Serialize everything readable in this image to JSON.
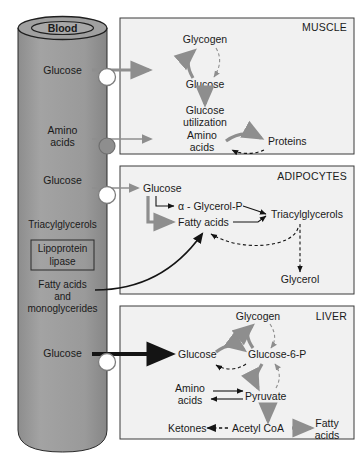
{
  "figure": {
    "type": "biochemical-pathway-diagram"
  },
  "colors": {
    "vessel_fill": "#9a9a9a",
    "tissue_box_fill": "#f1f1f1",
    "tissue_box_border": "#3a3a3a",
    "gray_arrow": "#8e8e8e",
    "black_arrow": "#141414",
    "text": "#1a1a1a",
    "open_transporter": "#ffffff",
    "filled_transporter": "#8e8e8e"
  },
  "blood_vessel": {
    "cap_label": "Blood",
    "substrates": [
      {
        "id": "vessel-glucose-muscle",
        "label": "Glucose"
      },
      {
        "id": "vessel-amino-acids",
        "label": "Amino\nacids",
        "line1": "Amino",
        "line2": "acids"
      },
      {
        "id": "vessel-glucose-adipocyte",
        "label": "Glucose"
      },
      {
        "id": "vessel-triacylglycerols",
        "label": "Triacylglycerols"
      },
      {
        "id": "vessel-fatty-acids-monoglycerides",
        "line1": "Fatty acids",
        "line2": "and",
        "line3": "monoglycerides"
      },
      {
        "id": "vessel-glucose-liver",
        "label": "Glucose"
      }
    ],
    "enzyme_box": {
      "line1": "Lipoprotein",
      "line2": "lipase"
    }
  },
  "tissues": [
    {
      "id": "muscle",
      "name": "MUSCLE",
      "nodes": [
        {
          "id": "muscle-glycogen",
          "label": "Glycogen"
        },
        {
          "id": "muscle-glucose",
          "label": "Glucose"
        },
        {
          "id": "muscle-glucose-utilization-1",
          "label": "Glucose"
        },
        {
          "id": "muscle-glucose-utilization-2",
          "label": "utilization"
        },
        {
          "id": "muscle-amino-acids-1",
          "label": "Amino"
        },
        {
          "id": "muscle-amino-acids-2",
          "label": "acids"
        },
        {
          "id": "muscle-proteins",
          "label": "Proteins"
        }
      ],
      "reactions": [
        {
          "from": "Glucose",
          "to": "Glycogen",
          "style": "solid-gray"
        },
        {
          "from": "Glycogen",
          "to": "Glucose",
          "style": "dashed-gray"
        },
        {
          "from": "Glucose",
          "to": "Glucose utilization",
          "style": "solid-gray"
        },
        {
          "from": "Amino acids",
          "to": "Proteins",
          "style": "solid-gray"
        },
        {
          "from": "Proteins",
          "to": "Amino acids",
          "style": "dashed-black"
        }
      ]
    },
    {
      "id": "adipocytes",
      "name": "ADIPOCYTES",
      "nodes": [
        {
          "id": "adipo-glucose",
          "label": "Glucose"
        },
        {
          "id": "adipo-glycerol-p",
          "label": "α - Glycerol-P"
        },
        {
          "id": "adipo-fatty-acids",
          "label": "Fatty acids"
        },
        {
          "id": "adipo-triacylglycerols",
          "label": "Triacylglycerols"
        },
        {
          "id": "adipo-glycerol",
          "label": "Glycerol"
        }
      ],
      "reactions": [
        {
          "from": "Glucose",
          "to": "α - Glycerol-P",
          "style": "solid-black"
        },
        {
          "from": "Glucose",
          "to": "Fatty acids",
          "style": "solid-gray"
        },
        {
          "from": "α - Glycerol-P",
          "to": "Triacylglycerols",
          "style": "solid-black"
        },
        {
          "from": "Fatty acids",
          "to": "Triacylglycerols",
          "style": "solid-black"
        },
        {
          "from": "Triacylglycerols",
          "to": "Fatty acids",
          "style": "dashed-black"
        },
        {
          "from": "Triacylglycerols",
          "to": "Glycerol",
          "style": "dashed-black"
        }
      ]
    },
    {
      "id": "liver",
      "name": "LIVER",
      "nodes": [
        {
          "id": "liver-glycogen",
          "label": "Glycogen"
        },
        {
          "id": "liver-glucose",
          "label": "Glucose"
        },
        {
          "id": "liver-glucose-6-p",
          "label": "Glucose-6-P"
        },
        {
          "id": "liver-amino-acids-1",
          "label": "Amino"
        },
        {
          "id": "liver-amino-acids-2",
          "label": "acids"
        },
        {
          "id": "liver-pyruvate",
          "label": "Pyruvate"
        },
        {
          "id": "liver-ketones",
          "label": "Ketones"
        },
        {
          "id": "liver-acetyl-coa",
          "label": "Acetyl CoA"
        },
        {
          "id": "liver-fatty-acids-1",
          "label": "Fatty"
        },
        {
          "id": "liver-fatty-acids-2",
          "label": "acids"
        }
      ],
      "reactions": [
        {
          "from": "Glucose",
          "to": "Glucose-6-P",
          "style": "solid-gray"
        },
        {
          "from": "Glucose-6-P",
          "to": "Glucose",
          "style": "dashed-black"
        },
        {
          "from": "Glucose-6-P",
          "to": "Glycogen",
          "style": "solid-gray"
        },
        {
          "from": "Glycogen",
          "to": "Glucose-6-P",
          "style": "dashed-gray"
        },
        {
          "from": "Glucose-6-P",
          "to": "Pyruvate",
          "style": "solid-gray"
        },
        {
          "from": "Pyruvate",
          "to": "Glucose-6-P",
          "style": "dashed-gray"
        },
        {
          "from": "Amino acids",
          "to": "Pyruvate",
          "style": "solid-black"
        },
        {
          "from": "Pyruvate",
          "to": "Amino acids",
          "style": "solid-black"
        },
        {
          "from": "Pyruvate",
          "to": "Acetyl CoA",
          "style": "solid-gray"
        },
        {
          "from": "Acetyl CoA",
          "to": "Ketones",
          "style": "dashed-black"
        },
        {
          "from": "Acetyl CoA",
          "to": "Fatty acids",
          "style": "solid-gray"
        }
      ]
    }
  ],
  "transporters": [
    {
      "id": "transporter-glucose-muscle",
      "type": "open"
    },
    {
      "id": "transporter-amino-acids-muscle",
      "type": "filled"
    },
    {
      "id": "transporter-glucose-adipocyte",
      "type": "open"
    },
    {
      "id": "transporter-glucose-liver",
      "type": "open"
    }
  ]
}
